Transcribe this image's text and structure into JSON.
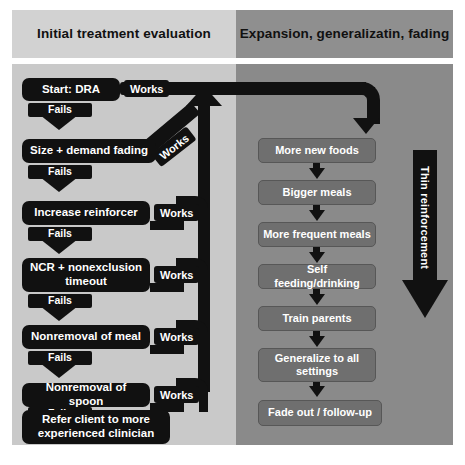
{
  "diagram": {
    "colors": {
      "left_panel_bg": "#c9c9c9",
      "left_header_bg": "#d2d2d2",
      "right_panel_bg": "#8a8a8a",
      "right_header_bg": "#8f8f8f",
      "node_black": "#111111",
      "node_gray": "#6f6f6f",
      "text_light": "#ffffff",
      "text_dark": "#111111"
    }
  },
  "columns": {
    "left": {
      "header": "Initial treatment evaluation",
      "steps": [
        {
          "label": "Start: DRA"
        },
        {
          "label": "Size + demand fading"
        },
        {
          "label": "Increase reinforcer"
        },
        {
          "label": "NCR + nonexclusion timeout"
        },
        {
          "label": "Nonremoval of meal"
        },
        {
          "label": "Nonremoval of spoon"
        },
        {
          "label": "Refer client to more experienced clinician"
        }
      ],
      "fail_labels": [
        "Fails",
        "Fails",
        "Fails",
        "Fails",
        "Fails",
        "Fails"
      ],
      "works_labels": [
        "Works",
        "Works",
        "Works",
        "Works",
        "Works",
        "Works"
      ]
    },
    "right": {
      "header": "Expansion, generalizatin, fading",
      "steps": [
        {
          "label": "More new foods"
        },
        {
          "label": "Bigger meals"
        },
        {
          "label": "More frequent meals"
        },
        {
          "label": "Self feeding/drinking"
        },
        {
          "label": "Train parents"
        },
        {
          "label": "Generalize to all settings"
        },
        {
          "label": "Fade out / follow-up"
        }
      ],
      "side_arrow_label": "Thin reinforcement"
    }
  }
}
